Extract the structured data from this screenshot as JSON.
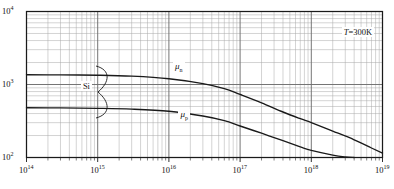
{
  "figure": {
    "title": "",
    "annotation_temperature": "T=300K",
    "material_label": "Si"
  },
  "axes": {
    "x": {
      "label": "",
      "scale": "log",
      "min": 100000000000000.0,
      "max": 1e+19,
      "tick_labels": [
        "10",
        "10",
        "10",
        "10",
        "10",
        "10"
      ],
      "tick_exponents": [
        "14",
        "15",
        "16",
        "17",
        "18",
        "19"
      ],
      "tick_values": [
        100000000000000.0,
        1000000000000000.0,
        1e+16,
        1e+17,
        1e+18,
        1e+19
      ]
    },
    "y": {
      "label": "",
      "scale": "log",
      "min": 100,
      "max": 10000,
      "tick_labels": [
        "10",
        "10",
        "10"
      ],
      "tick_exponents": [
        "4",
        "3",
        "2"
      ],
      "tick_values": [
        10000,
        1000,
        100
      ]
    }
  },
  "curves": {
    "electron_label_base": "μ",
    "electron_label_sub": "n",
    "hole_label_base": "μ",
    "hole_label_sub": "p"
  },
  "colors": {
    "frame": "#1a1a1a",
    "major_grid": "#6e6e6e",
    "minor_grid": "#a8a8a8",
    "curve": "#1a1a1a",
    "background": "#ffffff"
  },
  "chart_data": {
    "type": "line",
    "title": "",
    "xlabel": "",
    "ylabel": "",
    "xscale": "log",
    "yscale": "log",
    "xlim": [
      100000000000000.0,
      1e+19
    ],
    "ylim": [
      100,
      10000
    ],
    "grid": true,
    "legend": "inline-annotations",
    "annotations": [
      {
        "text": "T=300K",
        "x": 4.2e+18,
        "y": 5200
      },
      {
        "text": "Si",
        "x": 650000000000000.0,
        "y": 940
      },
      {
        "text": "μn",
        "x": 1.3e+16,
        "y": 1820
      },
      {
        "text": "μp",
        "x": 1.55e+16,
        "y": 400
      }
    ],
    "series": [
      {
        "name": "μn",
        "x": [
          100000000000000.0,
          300000000000000.0,
          1000000000000000.0,
          3000000000000000.0,
          1e+16,
          3e+16,
          6e+16,
          1e+17,
          2e+17,
          4e+17,
          7e+17,
          1e+18,
          2e+18,
          4e+18,
          7e+18,
          1e+19
        ],
        "y": [
          1360,
          1355,
          1340,
          1300,
          1200,
          1030,
          880,
          730,
          560,
          420,
          340,
          300,
          230,
          175,
          135,
          115
        ]
      },
      {
        "name": "μp",
        "x": [
          100000000000000.0,
          300000000000000.0,
          1000000000000000.0,
          3000000000000000.0,
          1e+16,
          3e+16,
          6e+16,
          1e+17,
          2e+17,
          4e+17,
          7e+17,
          1e+18,
          2e+18,
          3e+18,
          4e+18
        ],
        "y": [
          480,
          478,
          472,
          460,
          430,
          370,
          320,
          270,
          215,
          170,
          140,
          125,
          108,
          102,
          100
        ]
      }
    ]
  }
}
